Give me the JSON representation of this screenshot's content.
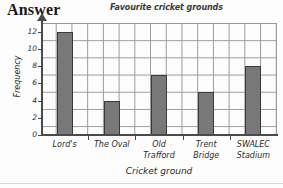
{
  "heading": {
    "label": "Answer"
  },
  "chart_data": {
    "type": "bar",
    "title": "Favourite cricket grounds",
    "xlabel": "Cricket ground",
    "ylabel": "Frequency",
    "categories": [
      "Lord's",
      "The Oval",
      "Old Trafford",
      "Trent Bridge",
      "SWALEC Stadium"
    ],
    "values": [
      12,
      4,
      7,
      5,
      8
    ],
    "ylim": [
      0,
      13
    ],
    "yticks": [
      0,
      2,
      4,
      6,
      8,
      10,
      12
    ],
    "ytick_labels": [
      "0",
      "2",
      "4",
      "6",
      "8",
      "10",
      "12"
    ],
    "grid": true,
    "legend": false,
    "bar_color": "#787878",
    "bar_edge_color": "#3a3a3a",
    "grid_color": "#9a9a9a",
    "axis_color": "#4a4a4a"
  }
}
